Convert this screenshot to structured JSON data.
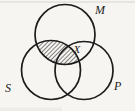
{
  "figure": {
    "kind": "three-circle-venn-diagram",
    "labels": {
      "m": "M",
      "s": "S",
      "p": "P",
      "x_mark": "X"
    },
    "circles": [
      {
        "label": "M",
        "position": "top",
        "cx": 65,
        "cy": 34.5,
        "r": 30
      },
      {
        "label": "S",
        "position": "bottom-left",
        "cx": 51,
        "cy": 70,
        "r": 29.5
      },
      {
        "label": "P",
        "position": "bottom-right",
        "cx": 84,
        "cy": 70.5,
        "r": 29
      }
    ],
    "shading": {
      "region": "M∩S",
      "style": "diagonal-hatch"
    },
    "x_mark_region": "M∩P",
    "colors": {
      "ink": "#1c1c1c",
      "paper": "#f6f5f1",
      "rule": "#cfccc5",
      "smudge": "#e6e4dd"
    }
  }
}
